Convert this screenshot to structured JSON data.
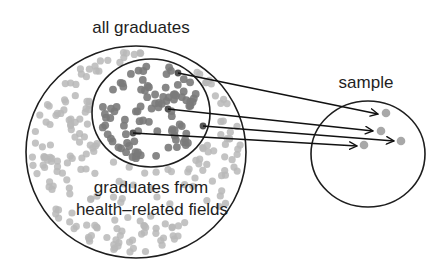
{
  "labels": {
    "population": "all graduates",
    "subgroup_line1": "graduates from",
    "subgroup_line2": "health–related fields",
    "sample": "sample"
  },
  "colors": {
    "outline": "#1e1e1e",
    "arrow": "#111111",
    "population_dot": "#b9b9b9",
    "subgroup_dot": "#7a7a7a",
    "sample_dot": "#a8a8a8",
    "background": "#ffffff"
  },
  "shapes": {
    "population_circle": {
      "cx": 136,
      "cy": 152,
      "rx": 110,
      "ry": 106
    },
    "subgroup_circle": {
      "cx": 151,
      "cy": 113,
      "rx": 59,
      "ry": 54
    },
    "sample_circle": {
      "cx": 368,
      "cy": 154,
      "rx": 57,
      "ry": 53
    }
  },
  "arrows": [
    {
      "from": [
        178,
        73
      ],
      "to": [
        378,
        114
      ]
    },
    {
      "from": [
        168,
        109
      ],
      "to": [
        373,
        131
      ]
    },
    {
      "from": [
        203,
        126
      ],
      "to": [
        394,
        141
      ]
    },
    {
      "from": [
        133,
        133
      ],
      "to": [
        357,
        146
      ]
    }
  ],
  "sample_points": [
    [
      386,
      113
    ],
    [
      381,
      131
    ],
    [
      401,
      141
    ],
    [
      364,
      145
    ]
  ],
  "dot_counts": {
    "population": 210,
    "subgroup": 95
  }
}
